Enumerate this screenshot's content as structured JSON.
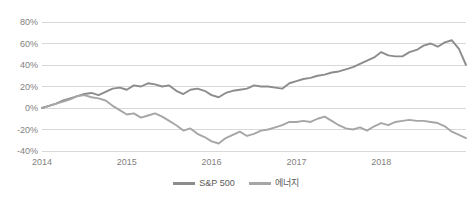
{
  "chart_data": {
    "type": "line",
    "title": "",
    "xlabel": "",
    "ylabel": "",
    "ylim": [
      -40,
      80
    ],
    "xlim": [
      2014.0,
      2019.0
    ],
    "grid": true,
    "legend_position": "bottom",
    "ytick_labels": [
      "80%",
      "60%",
      "40%",
      "20%",
      "0%",
      "-20%",
      "-40%"
    ],
    "ytick_values": [
      80,
      60,
      40,
      20,
      0,
      -20,
      -40
    ],
    "xtick_labels": [
      "2014",
      "2015",
      "2016",
      "2017",
      "2018"
    ],
    "xtick_values": [
      2014,
      2015,
      2016,
      2017,
      2018
    ],
    "colors": {
      "sp500": "#8c8c8c",
      "energy": "#a6a6a6",
      "gridline": "#d9d9d9",
      "tick_text": "#7f7f7f"
    },
    "x": [
      2014.0,
      2014.083,
      2014.167,
      2014.25,
      2014.333,
      2014.417,
      2014.5,
      2014.583,
      2014.667,
      2014.75,
      2014.833,
      2014.917,
      2015.0,
      2015.083,
      2015.167,
      2015.25,
      2015.333,
      2015.417,
      2015.5,
      2015.583,
      2015.667,
      2015.75,
      2015.833,
      2015.917,
      2016.0,
      2016.083,
      2016.167,
      2016.25,
      2016.333,
      2016.417,
      2016.5,
      2016.583,
      2016.667,
      2016.75,
      2016.833,
      2016.917,
      2017.0,
      2017.083,
      2017.167,
      2017.25,
      2017.333,
      2017.417,
      2017.5,
      2017.583,
      2017.667,
      2017.75,
      2017.833,
      2017.917,
      2018.0,
      2018.083,
      2018.167,
      2018.25,
      2018.333,
      2018.417,
      2018.5,
      2018.583,
      2018.667,
      2018.75,
      2018.833,
      2018.917,
      2019.0
    ],
    "series": [
      {
        "name": "S&P 500",
        "color": "#8c8c8c",
        "values": [
          0,
          2,
          4,
          7,
          9,
          11,
          13,
          14,
          12,
          15,
          18,
          19,
          17,
          21,
          20,
          23,
          22,
          20,
          21,
          16,
          13,
          17,
          18,
          16,
          12,
          10,
          14,
          16,
          17,
          18,
          21,
          20,
          20,
          19,
          18,
          23,
          25,
          27,
          28,
          30,
          31,
          33,
          34,
          36,
          38,
          41,
          44,
          47,
          52,
          49,
          48,
          48,
          52,
          54,
          58,
          60,
          57,
          61,
          63,
          55,
          40
        ]
      },
      {
        "name": "에너지",
        "color": "#a6a6a6",
        "values": [
          0,
          2,
          4,
          6,
          8,
          11,
          12,
          10,
          9,
          7,
          2,
          -2,
          -6,
          -5,
          -9,
          -7,
          -5,
          -8,
          -12,
          -16,
          -21,
          -19,
          -24,
          -27,
          -31,
          -33,
          -28,
          -25,
          -22,
          -26,
          -24,
          -21,
          -20,
          -18,
          -16,
          -13,
          -13,
          -12,
          -13,
          -10,
          -8,
          -12,
          -16,
          -19,
          -20,
          -18,
          -21,
          -17,
          -14,
          -16,
          -13,
          -12,
          -11,
          -12,
          -12,
          -13,
          -14,
          -17,
          -22,
          -25,
          -28
        ]
      }
    ]
  }
}
